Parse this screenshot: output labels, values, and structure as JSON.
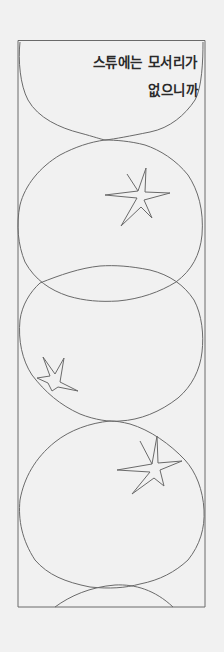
{
  "comic_panel": {
    "caption": {
      "line1": "스튜에는 모서리가",
      "line2": "없으니까"
    },
    "frame": {
      "left": 17,
      "top": 40,
      "right": 205,
      "bottom": 607
    },
    "colors": {
      "background": "#f1f1f1",
      "line": "#6a6a6a",
      "text": "#2a2a2a"
    },
    "elements": [
      "bowl-shape-1",
      "bowl-shape-2-with-star",
      "bowl-shape-3-with-star",
      "bowl-shape-4-with-star",
      "bowl-shape-5-partial"
    ]
  }
}
